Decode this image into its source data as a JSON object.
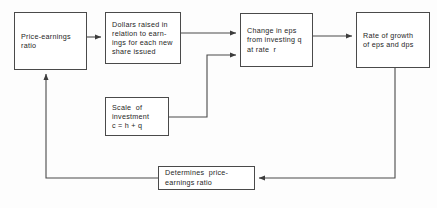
{
  "diagram": {
    "type": "flowchart",
    "stroke_color": "#4a4a4a",
    "text_color": "#262626",
    "background_color": "#fdfdfd",
    "nodes": [
      {
        "id": "price_earnings",
        "lines": [
          "Price-earnings",
          "ratio"
        ]
      },
      {
        "id": "dollars_raised",
        "lines": [
          "Dollars raised in",
          "relation to earn-",
          "ings for each new",
          "share issued"
        ]
      },
      {
        "id": "change_eps",
        "lines": [
          "Change in eps",
          "from investing q",
          "at rate  r"
        ]
      },
      {
        "id": "rate_growth",
        "lines": [
          "Rate of growth",
          "of eps and dps"
        ]
      },
      {
        "id": "scale_investment",
        "lines": [
          "Scale  of",
          "investment",
          "c = h + q"
        ]
      },
      {
        "id": "determines",
        "lines": [
          "Determines  price-",
          "earnings ratio"
        ]
      }
    ],
    "edges": [
      {
        "id": "price-to-dollars",
        "from": "price_earnings",
        "to": "dollars_raised"
      },
      {
        "id": "dollars-to-change",
        "from": "dollars_raised",
        "to": "change_eps"
      },
      {
        "id": "scale-to-change",
        "from": "scale_investment",
        "to": "change_eps"
      },
      {
        "id": "change-to-rate",
        "from": "change_eps",
        "to": "rate_growth"
      },
      {
        "id": "rate-to-determines",
        "from": "rate_growth",
        "to": "determines"
      },
      {
        "id": "determines-to-price",
        "from": "determines",
        "to": "price_earnings"
      }
    ]
  }
}
